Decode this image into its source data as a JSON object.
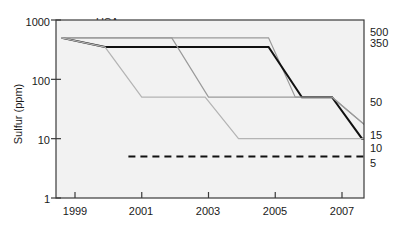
{
  "chart_data": {
    "type": "line",
    "title": "",
    "xlabel": "",
    "ylabel": "Sulfur (ppm)",
    "yscale": "log",
    "ylim": [
      1,
      1000
    ],
    "xlim": [
      1998,
      2008.2
    ],
    "grid": false,
    "legend_position": "inline-annotations",
    "y_ticks": [
      "1000",
      "100",
      "10",
      "1"
    ],
    "y_tick_values": [
      1000,
      100,
      10,
      1
    ],
    "x_ticks": [
      "1999",
      "2001",
      "2003",
      "2005",
      "2007"
    ],
    "x_tick_values": [
      1999,
      2001,
      2003,
      2005,
      2007
    ],
    "right_axis_labels": [
      "500",
      "350",
      "50",
      "15",
      "10",
      "5"
    ],
    "right_axis_values": [
      500,
      350,
      50,
      15,
      10,
      5
    ],
    "series": [
      {
        "name": "USA",
        "style": "solid-gray",
        "color": "#9a9a9a",
        "label": "USA",
        "points": [
          {
            "x": 1998.6,
            "y": 500
          },
          {
            "x": 2004.8,
            "y": 500
          },
          {
            "x": 2005.6,
            "y": 50
          },
          {
            "x": 2006.7,
            "y": 50
          },
          {
            "x": 2007.8,
            "y": 15
          },
          {
            "x": 2008.2,
            "y": 15
          }
        ]
      },
      {
        "name": "Europe",
        "style": "solid-black-thick",
        "color": "#111111",
        "label": "Europe",
        "points": [
          {
            "x": 1998.6,
            "y": 500
          },
          {
            "x": 1999.9,
            "y": 350
          },
          {
            "x": 2004.8,
            "y": 350
          },
          {
            "x": 2005.8,
            "y": 50
          },
          {
            "x": 2006.7,
            "y": 50
          },
          {
            "x": 2007.6,
            "y": 10
          },
          {
            "x": 2008.2,
            "y": 10
          }
        ]
      },
      {
        "name": "Japan",
        "style": "solid-gray",
        "color": "#9a9a9a",
        "label": "Japan",
        "points": [
          {
            "x": 1998.6,
            "y": 500
          },
          {
            "x": 2001.9,
            "y": 500
          },
          {
            "x": 2003.0,
            "y": 50
          },
          {
            "x": 2006.7,
            "y": 50
          },
          {
            "x": 2007.8,
            "y": 15
          },
          {
            "x": 2008.2,
            "y": 15
          }
        ]
      },
      {
        "name": "Germany",
        "style": "solid-gray",
        "color": "#b4b4b4",
        "label": "Germany",
        "points": [
          {
            "x": 1998.6,
            "y": 500
          },
          {
            "x": 1999.9,
            "y": 350
          },
          {
            "x": 2001.0,
            "y": 50
          },
          {
            "x": 2002.9,
            "y": 50
          },
          {
            "x": 2003.9,
            "y": 10
          },
          {
            "x": 2008.2,
            "y": 10
          }
        ]
      },
      {
        "name": "Automobile manufacturers",
        "style": "dashed-black",
        "color": "#111111",
        "label": "Automobile\nmanufacturers",
        "points": [
          {
            "x": 2000.6,
            "y": 5
          },
          {
            "x": 2008.2,
            "y": 5
          }
        ]
      }
    ],
    "annotations": [
      {
        "text": "USA",
        "x": 2001.6,
        "y": 760
      },
      {
        "text": "Europe",
        "x": 2005.3,
        "y": 270
      },
      {
        "text": "Japan",
        "x": 2005.5,
        "y": 62
      },
      {
        "text": "Germany",
        "x": 2003.6,
        "y": 20
      },
      {
        "text": "Automobile",
        "x": 2005.2,
        "y": 3.4
      },
      {
        "text": "manufacturers",
        "x": 2005.2,
        "y": 2.5
      }
    ]
  },
  "axes": {
    "y_label": "Sulfur (ppm)",
    "y_ticks": [
      "1000",
      "100",
      "10",
      "1"
    ],
    "x_ticks": [
      "1999",
      "2001",
      "2003",
      "2005",
      "2007"
    ],
    "right_labels": [
      "500",
      "350",
      "50",
      "15",
      "10",
      "5"
    ]
  },
  "labels": {
    "usa": "USA",
    "europe": "Europe",
    "japan": "Japan",
    "germany": "Germany",
    "auto_line1": "Automobile",
    "auto_line2": "manufacturers"
  },
  "colors": {
    "plot_background": "#f2f2f2",
    "frame": "#3a3a3a",
    "usa_line": "#9a9a9a",
    "europe_line": "#111111",
    "japan_line": "#9a9a9a",
    "germany_line": "#b4b4b4",
    "auto_line": "#111111",
    "text": "#1a1a1a"
  }
}
